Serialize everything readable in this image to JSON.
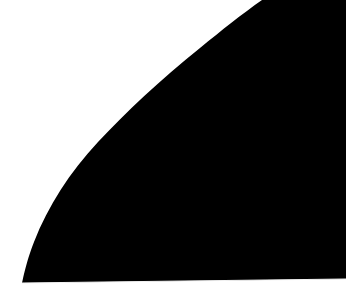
{
  "image": {
    "width": 346,
    "height": 304,
    "description": "Abstract graphic: large solid black mass occupying the lower-right of the frame, bounded by a single smooth concave curve sweeping from the top edge down to the bottom-left, over a plain white background.",
    "alt_text": "Solid black curved shape on a white background"
  },
  "colors": {
    "background": "#ffffff",
    "shape_fill": "#000000",
    "edge_antialias": "#f2f2f2",
    "bottom_strip": "#ffffff"
  },
  "geometry": {
    "shape_name": "curved-black-mass",
    "fill_color": "#000000",
    "background_color": "#ffffff",
    "curve_type": "elliptical-arc",
    "top_edge_crossing_x": 262,
    "bottom_edge_crossing_x": 22,
    "bottom_edge_y_left": 283,
    "bottom_edge_y_right": 279,
    "bottom_strip_height": 20,
    "curve_points": [
      [
        262,
        0
      ],
      [
        240,
        20
      ],
      [
        205,
        50
      ],
      [
        175,
        70
      ],
      [
        152,
        100
      ],
      [
        143,
        110
      ],
      [
        120,
        130
      ],
      [
        105,
        140
      ],
      [
        80,
        180
      ],
      [
        58,
        200
      ],
      [
        28,
        260
      ],
      [
        22,
        283
      ]
    ],
    "shape_path": "M 262,0 L 346,0 L 346,279 L 22,283 C 22,283 26,262 34,242 C 48,206 70,172 98,142 C 126,112 160,80 200,48 C 222,30 242,14 262,0 Z",
    "edge_line_path": "M 22,283 L 346,279"
  }
}
